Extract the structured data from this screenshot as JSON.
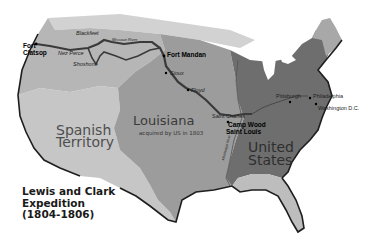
{
  "title": {
    "line1": "Lewis and Clark",
    "line2": "Expedition",
    "line3": "(1804-1806)"
  },
  "regions": {
    "spanish": {
      "line1": "Spanish",
      "line2": "Territory",
      "color": "#c4c4c4"
    },
    "louisiana": {
      "name": "Louisiana",
      "note": "acquired by US in 1803",
      "color": "#9c9c9c"
    },
    "united_states": {
      "line1": "United",
      "line2": "States",
      "color": "#6e6e6e"
    },
    "northwest": {
      "color": "#b8b8b8"
    },
    "british_north": {
      "color": "#cfcfcf"
    },
    "florida": {
      "color": "#bdbdbd"
    },
    "maine": {
      "color": "#aaaaaa"
    }
  },
  "places": {
    "fort_clatsop": {
      "line1": "Fort",
      "line2": "Clatsop"
    },
    "fort_mandan": "Fort Mandan",
    "camp_wood": "Camp Wood",
    "saint_louis": "Saint Louis",
    "saint_charles": "Saint Charles",
    "pittsburgh": "Pittsburgh",
    "philadelphia": "Philadelphia",
    "washington": "Washington D.C.",
    "blackfeet": "Blackfeet",
    "nez_perce": "Nez Perce",
    "shoshone": "Shoshone",
    "sioux": "Sioux",
    "floyd": "Floyd",
    "missouri_river": "Missouri River",
    "mississippi_river": "Mississippi River"
  },
  "colors": {
    "route": "#3a3a3a",
    "coast": "#1e1e1e",
    "background": "#ffffff"
  }
}
